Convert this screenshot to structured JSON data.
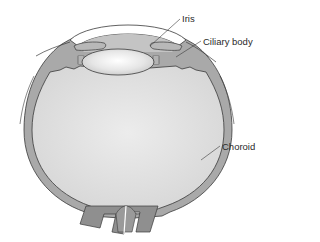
{
  "diagram": {
    "labels": [
      {
        "id": "iris",
        "text": "Iris",
        "x": 182,
        "y": 14
      },
      {
        "id": "ciliary-body",
        "text": "Ciliary body",
        "x": 203,
        "y": 37
      },
      {
        "id": "choroid",
        "text": "Choroid",
        "x": 222,
        "y": 142
      }
    ],
    "colors": {
      "background": "#ffffff",
      "sclera_choroid_fill": "#a9a9a9",
      "vitreous_fill": "#dcdcdc",
      "lens_fill": "#e8e8e8",
      "cornea_fill": "#ffffff",
      "outline": "#3a3a3a",
      "optic_nerve_fill": "#8f8f8f",
      "label_text": "#2a2a2a"
    }
  }
}
